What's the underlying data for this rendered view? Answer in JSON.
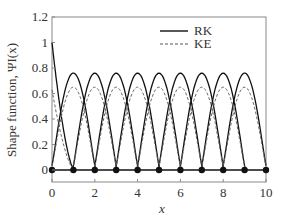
{
  "chart_data": {
    "type": "line",
    "title": "",
    "xlabel": "x",
    "ylabel": "Shape function, ΨI(x)",
    "xlim": [
      0,
      10
    ],
    "ylim": [
      0,
      1.2
    ],
    "xticks": [
      "0",
      "2",
      "4",
      "6",
      "8",
      "10"
    ],
    "yticks": [
      "0",
      "0.2",
      "0.4",
      "0.6",
      "0.8",
      "1",
      "1.2"
    ],
    "legend": {
      "position": "upper center",
      "entries": [
        "RK",
        "KE"
      ]
    },
    "nodes_x": [
      0,
      1,
      2,
      3,
      4,
      5,
      6,
      7,
      8,
      9,
      10
    ],
    "series": [
      {
        "name": "RK",
        "style": "solid",
        "peak_interior": 0.76,
        "peak_boundary": 1.0
      },
      {
        "name": "KE",
        "style": "dashed",
        "peak_interior": 0.65,
        "peak_boundary": 0.63
      }
    ]
  }
}
